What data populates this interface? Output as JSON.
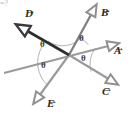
{
  "figure": {
    "origin": {
      "x": 69,
      "y": 55
    },
    "canvas": {
      "width": 131,
      "height": 115
    },
    "colors": {
      "gray_vector": "#9b9b9b",
      "dark_vector": "#2e2e2e",
      "arc": "#a8a8a8",
      "label_text": "#2b2b2b",
      "angle_text": "#3a3a3a",
      "background": "#ffffff"
    },
    "corner_artifact": "=?"
  },
  "vectors": [
    {
      "id": "A",
      "label": "A",
      "color": "#9b9b9b",
      "stroke_width": 2.2,
      "tip": {
        "x": 120,
        "y": 43
      },
      "tail": {
        "x": 4,
        "y": 73
      },
      "label_pos": {
        "x": 114,
        "y": 50
      },
      "head_style": "open",
      "emphasis": "normal"
    },
    {
      "id": "B",
      "label": "B",
      "color": "#7e7e7e",
      "stroke_width": 2.2,
      "tip": {
        "x": 97,
        "y": 4
      },
      "tail": {
        "x": 69,
        "y": 55
      },
      "label_pos": {
        "x": 101,
        "y": 11
      },
      "head_style": "open",
      "emphasis": "normal"
    },
    {
      "id": "C",
      "label": "C",
      "color": "#9b9b9b",
      "stroke_width": 2.2,
      "tip": {
        "x": 119,
        "y": 85
      },
      "tail": {
        "x": 69,
        "y": 55
      },
      "label_pos": {
        "x": 103,
        "y": 91
      },
      "head_style": "open",
      "emphasis": "normal"
    },
    {
      "id": "D",
      "label": "D",
      "color": "#2e2e2e",
      "stroke_width": 2.6,
      "tip": {
        "x": 15,
        "y": 24
      },
      "tail": {
        "x": 69,
        "y": 55
      },
      "label_pos": {
        "x": 25,
        "y": 11
      },
      "head_style": "open",
      "emphasis": "dark"
    },
    {
      "id": "E",
      "label": "E",
      "color": "#9b9b9b",
      "stroke_width": 2.2,
      "tip": {
        "x": 33,
        "y": 104
      },
      "tail": {
        "x": 69,
        "y": 55
      },
      "label_pos": {
        "x": 47,
        "y": 102
      },
      "head_style": "open",
      "emphasis": "normal"
    }
  ],
  "angles": [
    {
      "id": "theta-B-A",
      "symbol": "θ",
      "between": [
        "B",
        "A"
      ],
      "pos": {
        "x": 80,
        "y": 37
      },
      "arc_radius": 21
    },
    {
      "id": "theta-A-C",
      "symbol": "θ",
      "between": [
        "A",
        "C"
      ],
      "pos": {
        "x": 82,
        "y": 56
      },
      "arc_radius": 27
    },
    {
      "id": "theta-D-B",
      "symbol": "θ",
      "between": [
        "D",
        "B"
      ],
      "pos": {
        "x": 41,
        "y": 43
      },
      "arc_radius": 25
    },
    {
      "id": "theta-D-E",
      "symbol": "θ",
      "between": [
        "D",
        "E"
      ],
      "pos": {
        "x": 42,
        "y": 63
      },
      "arc_radius": 31
    }
  ]
}
